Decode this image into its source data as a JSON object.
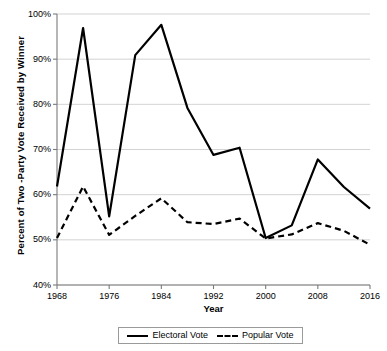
{
  "chart_data": {
    "type": "line",
    "title": "",
    "xlabel": "Year",
    "ylabel": "Percent of Two -Party Vote Received by Winner",
    "x": [
      1968,
      1972,
      1976,
      1980,
      1984,
      1988,
      1992,
      1996,
      2000,
      2004,
      2008,
      2012,
      2016
    ],
    "xlim": [
      1968,
      2016
    ],
    "ylim": [
      40,
      100
    ],
    "ytick_labels": [
      "100%",
      "90%",
      "80%",
      "70%",
      "60%",
      "50%",
      "40%"
    ],
    "ytick_values": [
      100,
      90,
      80,
      70,
      60,
      50,
      40
    ],
    "xtick_labels": [
      "1968",
      "1976",
      "1984",
      "1992",
      "2000",
      "2008",
      "2016"
    ],
    "xtick_values": [
      1968,
      1976,
      1984,
      1992,
      2000,
      2008,
      2016
    ],
    "grid": "horizontal",
    "legend_position": "bottom-center",
    "series": [
      {
        "name": "Electoral Vote",
        "style": "solid",
        "color": "#000000",
        "values": [
          61.8,
          96.9,
          55.2,
          90.9,
          97.6,
          79.2,
          68.8,
          70.4,
          50.4,
          53.2,
          67.8,
          61.7,
          56.9
        ]
      },
      {
        "name": "Popular Vote",
        "style": "dashed",
        "color": "#000000",
        "values": [
          50.4,
          61.8,
          51.1,
          55.3,
          59.2,
          53.9,
          53.5,
          54.7,
          50.3,
          51.2,
          53.7,
          52.0,
          48.9
        ]
      }
    ]
  },
  "legend": {
    "entries": [
      {
        "label": "Electoral Vote"
      },
      {
        "label": "Popular Vote"
      }
    ]
  }
}
